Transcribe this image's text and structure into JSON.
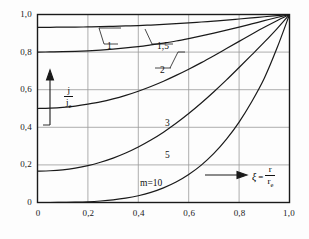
{
  "figure": {
    "background": "#fdfdfd",
    "frame_color": "#1a1a1a",
    "grid_color": "#9a9a9a",
    "curve_color": "#1a1a1a"
  },
  "axes": {
    "x": {
      "label_xi": "ξ",
      "label_eq": "=",
      "label_num": "r",
      "label_den": "r",
      "label_den_sub": "e",
      "ticks": [
        "0",
        "0,2",
        "0,4",
        "0,6",
        "0,8",
        "1,0"
      ],
      "values": [
        0,
        0.2,
        0.4,
        0.6,
        0.8,
        1.0
      ],
      "min": 0,
      "max": 1.0
    },
    "y": {
      "label_num": "j",
      "label_den": "j",
      "label_den_sub": "e",
      "ticks": [
        "0",
        "0,2",
        "0,4",
        "0,6",
        "0,8",
        "1,0"
      ],
      "values": [
        0,
        0.2,
        0.4,
        0.6,
        0.8,
        1.0
      ],
      "min": 0,
      "max": 1.0
    }
  },
  "curve_labels": [
    {
      "text": "1",
      "x": 107,
      "y": 41
    },
    {
      "text": "1,5",
      "x": 157,
      "y": 41
    },
    {
      "text": "2",
      "x": 160,
      "y": 65
    },
    {
      "text": "3",
      "x": 165,
      "y": 118
    },
    {
      "text": "5",
      "x": 165,
      "y": 150
    },
    {
      "text": "m=10",
      "x": 140,
      "y": 178
    }
  ],
  "chart_data": {
    "type": "line",
    "title": "",
    "xlabel": "ξ = r / r_e",
    "ylabel": "| j / j_e |",
    "xlim": [
      0,
      1.0
    ],
    "ylim": [
      0,
      1.0
    ],
    "grid": true,
    "legend": "inline curve labels",
    "x": [
      0,
      0.05,
      0.1,
      0.15,
      0.2,
      0.25,
      0.3,
      0.35,
      0.4,
      0.45,
      0.5,
      0.55,
      0.6,
      0.65,
      0.7,
      0.75,
      0.8,
      0.85,
      0.9,
      0.95,
      1.0
    ],
    "series": [
      {
        "name": "m=1",
        "label": "1",
        "values": [
          1.0,
          1.0,
          1.0,
          1.0,
          1.0,
          1.0,
          1.0,
          1.0,
          1.0,
          1.0,
          1.0,
          1.0,
          1.0,
          1.0,
          1.0,
          1.0,
          1.0,
          1.0,
          1.0,
          1.0,
          1.0
        ]
      },
      {
        "name": "m=1,5",
        "label": "1,5",
        "values": [
          0.932,
          0.932,
          0.933,
          0.933,
          0.934,
          0.935,
          0.937,
          0.939,
          0.941,
          0.944,
          0.947,
          0.951,
          0.955,
          0.96,
          0.965,
          0.97,
          0.976,
          0.982,
          0.988,
          0.994,
          1.0
        ]
      },
      {
        "name": "m=2",
        "label": "2",
        "values": [
          0.8,
          0.801,
          0.802,
          0.804,
          0.807,
          0.811,
          0.816,
          0.822,
          0.829,
          0.838,
          0.848,
          0.859,
          0.872,
          0.886,
          0.901,
          0.917,
          0.933,
          0.95,
          0.967,
          0.984,
          1.0
        ]
      },
      {
        "name": "m=3",
        "label": "3",
        "values": [
          0.5,
          0.502,
          0.506,
          0.513,
          0.523,
          0.535,
          0.551,
          0.57,
          0.592,
          0.617,
          0.645,
          0.676,
          0.709,
          0.744,
          0.781,
          0.819,
          0.857,
          0.895,
          0.932,
          0.967,
          1.0
        ]
      },
      {
        "name": "m=5",
        "label": "5",
        "values": [
          0.167,
          0.169,
          0.174,
          0.183,
          0.196,
          0.214,
          0.236,
          0.263,
          0.295,
          0.332,
          0.374,
          0.421,
          0.473,
          0.529,
          0.589,
          0.652,
          0.718,
          0.785,
          0.853,
          0.924,
          1.0
        ]
      },
      {
        "name": "m=10",
        "label": "m=10",
        "values": [
          0.0,
          0.0,
          0.001,
          0.002,
          0.004,
          0.008,
          0.014,
          0.023,
          0.036,
          0.054,
          0.078,
          0.109,
          0.149,
          0.199,
          0.261,
          0.337,
          0.428,
          0.536,
          0.661,
          0.82,
          1.0
        ]
      }
    ]
  }
}
